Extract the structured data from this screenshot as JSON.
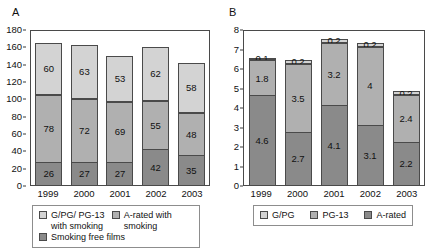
{
  "figure": {
    "panels": [
      {
        "letter": "A",
        "chart_data": {
          "type": "bar",
          "title": "",
          "xlabel": "",
          "ylabel": "",
          "stacked": true,
          "grid": false,
          "ylim": [
            0,
            180
          ],
          "yticks": [
            0,
            20,
            40,
            60,
            80,
            100,
            120,
            140,
            160,
            180
          ],
          "categories": [
            "1999",
            "2000",
            "2001",
            "2002",
            "2003"
          ],
          "series": [
            {
              "name": "G/PG/ PG-13 with smoking",
              "shade": "light",
              "values": [
                60,
                63,
                53,
                62,
                58
              ]
            },
            {
              "name": "A-rated with smoking",
              "shade": "medium",
              "values": [
                78,
                72,
                69,
                55,
                48
              ]
            },
            {
              "name": "Smoking free films",
              "shade": "dark",
              "values": [
                26,
                27,
                27,
                42,
                35
              ]
            }
          ],
          "legend_position": "bottom"
        },
        "legend": [
          {
            "label": "G/PG/ PG-13 with smoking",
            "shade": "light"
          },
          {
            "label": "A-rated with smoking",
            "shade": "medium"
          },
          {
            "label": "Smoking free films",
            "shade": "dark"
          }
        ]
      },
      {
        "letter": "B",
        "chart_data": {
          "type": "bar",
          "title": "",
          "xlabel": "",
          "ylabel": "",
          "stacked": true,
          "grid": false,
          "ylim": [
            0,
            8
          ],
          "yticks": [
            0,
            1,
            2,
            3,
            4,
            5,
            6,
            7,
            8
          ],
          "categories": [
            "1999",
            "2000",
            "2001",
            "2002",
            "2003"
          ],
          "series": [
            {
              "name": "G/PG",
              "shade": "light",
              "values": [
                0.1,
                0.2,
                0.2,
                0.2,
                0.2
              ]
            },
            {
              "name": "PG-13",
              "shade": "medium",
              "values": [
                1.8,
                3.5,
                3.2,
                4.0,
                2.4
              ]
            },
            {
              "name": "A-rated",
              "shade": "dark",
              "values": [
                4.6,
                2.7,
                4.1,
                3.1,
                2.2
              ]
            }
          ],
          "legend_position": "bottom"
        },
        "legend": [
          {
            "label": "G/PG",
            "shade": "light"
          },
          {
            "label": "PG-13",
            "shade": "medium"
          },
          {
            "label": "A-rated",
            "shade": "dark"
          }
        ]
      }
    ]
  }
}
